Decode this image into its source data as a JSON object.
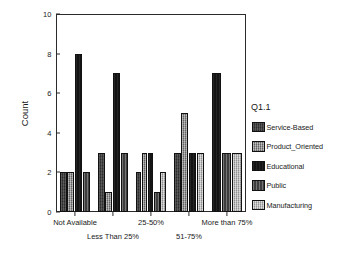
{
  "chart_data": {
    "type": "bar",
    "title": "",
    "xlabel": "",
    "ylabel": "Count",
    "ylim": [
      0,
      10
    ],
    "yticks": [
      0,
      2,
      4,
      6,
      8,
      10
    ],
    "grid": false,
    "legend_position": "right",
    "legend_title": "Q1.1",
    "categories": [
      "Not Available",
      "Less Than 25%",
      "25-50%",
      "51-75%",
      "More than 75%"
    ],
    "series": [
      {
        "name": "Service-Based",
        "color": "#3a3a3a",
        "values": [
          2,
          3,
          2,
          3,
          0
        ]
      },
      {
        "name": "Product_Oriented",
        "color": "#8d8d8d",
        "values": [
          2,
          1,
          3,
          5,
          0
        ]
      },
      {
        "name": "Educational",
        "color": "#141414",
        "values": [
          8,
          7,
          3,
          3,
          7
        ]
      },
      {
        "name": "Public",
        "color": "#4e4e4e",
        "values": [
          2,
          3,
          1,
          0,
          3
        ]
      },
      {
        "name": "Manufacturing",
        "color": "#b3b3b3",
        "values": [
          0,
          0,
          2,
          3,
          3
        ]
      }
    ]
  },
  "axis": {
    "y_tick_labels": [
      "0",
      "2",
      "4",
      "6",
      "8",
      "10"
    ],
    "y_axis_title": "Count",
    "x_tick_labels": [
      "Not Available",
      "Less Than 25%",
      "25-50%",
      "51-75%",
      "More than 75%"
    ]
  },
  "legend": {
    "title": "Q1.1",
    "items": [
      {
        "label": "Service-Based"
      },
      {
        "label": "Product_Oriented"
      },
      {
        "label": "Educational"
      },
      {
        "label": "Public"
      },
      {
        "label": "Manufacturing"
      }
    ]
  }
}
